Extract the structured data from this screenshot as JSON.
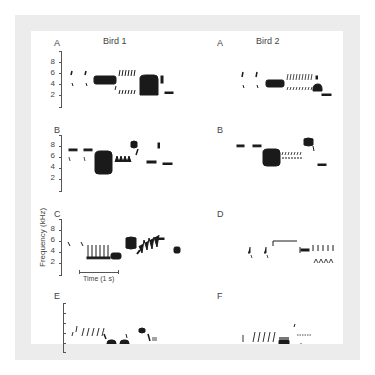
{
  "figure": {
    "columns": [
      "Bird 1",
      "Bird 2"
    ],
    "panels": [
      {
        "label": "A",
        "column": "Bird 1"
      },
      {
        "label": "A",
        "column": "Bird 2"
      },
      {
        "label": "B",
        "column": "Bird 1"
      },
      {
        "label": "B",
        "column": "Bird 2"
      },
      {
        "label": "C",
        "column": "Bird 1"
      },
      {
        "label": "D",
        "column": "Bird 2"
      },
      {
        "label": "E",
        "column": "Bird 1"
      },
      {
        "label": "F",
        "column": "Bird 2"
      }
    ],
    "y_axis": {
      "label": "Frequency (kHz)",
      "ticks": [
        "8",
        "6",
        "4",
        "2"
      ]
    },
    "time_scale": "Time (1 s)",
    "colors": {
      "frame": "#ececec",
      "panel": "#ffffff",
      "ink": "#1a1a1a"
    }
  }
}
